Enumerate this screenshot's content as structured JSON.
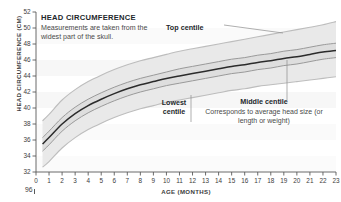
{
  "chart_data": {
    "type": "line",
    "title": "HEAD CIRCUMFERENCE",
    "xlabel": "AGE (MONTHS)",
    "ylabel": "HEAD CIRCUMFERENCE (CM)",
    "xlim": [
      0,
      23
    ],
    "ylim": [
      32,
      52
    ],
    "xticks": [
      "0",
      "1",
      "2",
      "3",
      "4",
      "5",
      "6",
      "7",
      "8",
      "9",
      "10",
      "11",
      "12",
      "13",
      "14",
      "15",
      "16",
      "17",
      "18",
      "19",
      "20",
      "21",
      "22",
      "23"
    ],
    "yticks": [
      "32",
      "34",
      "36",
      "38",
      "40",
      "42",
      "44",
      "46",
      "48",
      "50",
      "52"
    ],
    "grid": false,
    "legend": "none",
    "x": [
      0.5,
      1,
      2,
      3,
      4,
      5,
      6,
      7,
      8,
      9,
      10,
      11,
      12,
      13,
      14,
      15,
      16,
      17,
      18,
      19,
      20,
      21,
      22,
      23
    ],
    "series": [
      {
        "name": "Top centile",
        "values": [
          38.4,
          39.2,
          41.0,
          42.3,
          43.3,
          44.1,
          44.8,
          45.4,
          45.9,
          46.3,
          46.7,
          47.1,
          47.4,
          47.7,
          48.0,
          48.3,
          48.6,
          48.9,
          49.2,
          49.5,
          49.8,
          50.1,
          50.4,
          50.8
        ]
      },
      {
        "name": "Upper inner centile",
        "values": [
          36.3,
          37.1,
          38.8,
          40.1,
          41.1,
          41.9,
          42.6,
          43.2,
          43.7,
          44.1,
          44.5,
          44.9,
          45.2,
          45.5,
          45.8,
          46.1,
          46.3,
          46.6,
          46.8,
          47.1,
          47.3,
          47.6,
          47.9,
          48.1
        ]
      },
      {
        "name": "Middle centile",
        "values": [
          35.5,
          36.3,
          38.0,
          39.3,
          40.3,
          41.1,
          41.8,
          42.4,
          42.9,
          43.3,
          43.7,
          44.0,
          44.3,
          44.6,
          44.9,
          45.2,
          45.4,
          45.7,
          45.9,
          46.2,
          46.4,
          46.7,
          47.0,
          47.2
        ]
      },
      {
        "name": "Lower inner centile",
        "values": [
          34.6,
          35.4,
          37.1,
          38.4,
          39.4,
          40.2,
          40.9,
          41.5,
          42.0,
          42.4,
          42.8,
          43.1,
          43.4,
          43.7,
          44.0,
          44.3,
          44.5,
          44.8,
          45.0,
          45.3,
          45.5,
          45.8,
          46.1,
          46.3
        ]
      },
      {
        "name": "Lowest centile",
        "values": [
          32.6,
          33.3,
          35.0,
          36.3,
          37.3,
          38.1,
          38.8,
          39.4,
          39.9,
          40.3,
          40.7,
          41.0,
          41.3,
          41.6,
          41.9,
          42.2,
          42.4,
          42.7,
          42.9,
          43.1,
          43.3,
          43.5,
          43.7,
          43.9
        ]
      }
    ],
    "annotations": [
      {
        "label": "Top centile",
        "target": "top curve near 15 months"
      },
      {
        "label": "Lowest centile",
        "target": "lowest curve near 12.5 months"
      },
      {
        "label": "Middle centile",
        "target": "middle curve near 20 months"
      }
    ]
  },
  "figure": {
    "title": "HEAD CIRCUMFERENCE",
    "description": "Measurements are taken from the widest part of the skull.",
    "axis": {
      "y_label": "HEAD CIRCUMFERENCE (CM)",
      "x_label": "AGE (MONTHS)"
    },
    "callouts": {
      "top_centile": "Top centile",
      "lowest_centile_line1": "Lowest",
      "lowest_centile_line2": "centile",
      "middle_centile": "Middle centile",
      "middle_centile_body": "Corresponds to average head size (or length or weight)"
    },
    "next_chart_tick": "96",
    "colors": {
      "band": "#e9e9e9",
      "band_inner": "#dedede",
      "centile_line": "#b8b8b8",
      "middle_line": "#2b2b2b",
      "axis": "#5a5a5a",
      "text": "#3a3a3a",
      "heading": "#23272b"
    }
  }
}
